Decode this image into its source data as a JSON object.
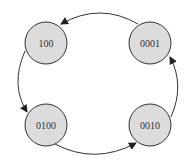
{
  "diagram": {
    "type": "state-cycle",
    "states": [
      {
        "id": "s100",
        "label": "100",
        "cx": 46,
        "cy": 43
      },
      {
        "id": "s0001",
        "label": "0001",
        "cx": 150,
        "cy": 43
      },
      {
        "id": "s0100",
        "label": "0100",
        "cx": 46,
        "cy": 125
      },
      {
        "id": "s0010",
        "label": "0010",
        "cx": 150,
        "cy": 125
      }
    ],
    "transitions": [
      {
        "from": "0001",
        "to": "100"
      },
      {
        "from": "100",
        "to": "0100"
      },
      {
        "from": "0100",
        "to": "0010"
      },
      {
        "from": "0010",
        "to": "0001"
      }
    ],
    "colors": {
      "node_fill": "#dcdcdc",
      "stroke": "#333333",
      "background": "#ffffff"
    }
  }
}
